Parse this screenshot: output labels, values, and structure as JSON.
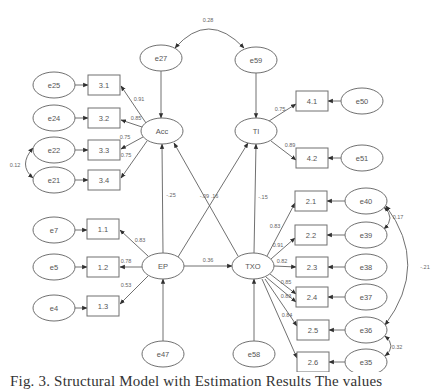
{
  "figure": {
    "caption": "Fig. 3.   Structural Model with Estimation Results  The values",
    "colors": {
      "stroke": "#707070",
      "text": "#555555",
      "background": "#ffffff"
    }
  },
  "latent": [
    {
      "id": "Acc",
      "label": "Acc",
      "x": 162,
      "y": 131,
      "rx": 21,
      "ry": 13
    },
    {
      "id": "TI",
      "label": "TI",
      "x": 256,
      "y": 131,
      "rx": 21,
      "ry": 13
    },
    {
      "id": "EP",
      "label": "EP",
      "x": 163,
      "y": 266,
      "rx": 21,
      "ry": 13
    },
    {
      "id": "TXO",
      "label": "TXO",
      "x": 253,
      "y": 266,
      "rx": 21,
      "ry": 13
    }
  ],
  "errors": [
    {
      "id": "e27",
      "label": "e27",
      "x": 161,
      "y": 58,
      "rx": 21,
      "ry": 13
    },
    {
      "id": "e59",
      "label": "e59",
      "x": 256,
      "y": 60,
      "rx": 21,
      "ry": 13
    },
    {
      "id": "e25",
      "label": "e25",
      "x": 54,
      "y": 85,
      "rx": 21,
      "ry": 13
    },
    {
      "id": "e24",
      "label": "e24",
      "x": 54,
      "y": 118,
      "rx": 21,
      "ry": 13
    },
    {
      "id": "e22",
      "label": "e22",
      "x": 54,
      "y": 150,
      "rx": 21,
      "ry": 13
    },
    {
      "id": "e21",
      "label": "e21",
      "x": 54,
      "y": 180,
      "rx": 21,
      "ry": 13
    },
    {
      "id": "e50",
      "label": "e50",
      "x": 362,
      "y": 101,
      "rx": 21,
      "ry": 13
    },
    {
      "id": "e51",
      "label": "e51",
      "x": 362,
      "y": 158,
      "rx": 21,
      "ry": 13
    },
    {
      "id": "e40",
      "label": "e40",
      "x": 366,
      "y": 201,
      "rx": 21,
      "ry": 13
    },
    {
      "id": "e39",
      "label": "e39",
      "x": 366,
      "y": 235,
      "rx": 21,
      "ry": 13
    },
    {
      "id": "e38",
      "label": "e38",
      "x": 366,
      "y": 267,
      "rx": 21,
      "ry": 13
    },
    {
      "id": "e37",
      "label": "e37",
      "x": 366,
      "y": 297,
      "rx": 21,
      "ry": 13
    },
    {
      "id": "e36",
      "label": "e36",
      "x": 366,
      "y": 330,
      "rx": 21,
      "ry": 13
    },
    {
      "id": "e35",
      "label": "e35",
      "x": 366,
      "y": 362,
      "rx": 21,
      "ry": 13
    },
    {
      "id": "e7",
      "label": "e7",
      "x": 54,
      "y": 230,
      "rx": 21,
      "ry": 13
    },
    {
      "id": "e5",
      "label": "e5",
      "x": 54,
      "y": 267,
      "rx": 21,
      "ry": 13
    },
    {
      "id": "e4",
      "label": "e4",
      "x": 54,
      "y": 308,
      "rx": 21,
      "ry": 13
    },
    {
      "id": "e47",
      "label": "e47",
      "x": 163,
      "y": 354,
      "rx": 21,
      "ry": 13
    },
    {
      "id": "e58",
      "label": "e58",
      "x": 254,
      "y": 354,
      "rx": 21,
      "ry": 13
    }
  ],
  "observed": [
    {
      "id": "3.1",
      "label": "3.1",
      "x": 104,
      "y": 85,
      "w": 32,
      "h": 20
    },
    {
      "id": "3.2",
      "label": "3.2",
      "x": 104,
      "y": 118,
      "w": 32,
      "h": 20
    },
    {
      "id": "3.3",
      "label": "3.3",
      "x": 104,
      "y": 150,
      "w": 32,
      "h": 20
    },
    {
      "id": "3.4",
      "label": "3.4",
      "x": 104,
      "y": 180,
      "w": 32,
      "h": 20
    },
    {
      "id": "4.1",
      "label": "4.1",
      "x": 312,
      "y": 101,
      "w": 32,
      "h": 20
    },
    {
      "id": "4.2",
      "label": "4.2",
      "x": 312,
      "y": 158,
      "w": 32,
      "h": 20
    },
    {
      "id": "2.1",
      "label": "2.1",
      "x": 311,
      "y": 201,
      "w": 32,
      "h": 20
    },
    {
      "id": "2.2",
      "label": "2.2",
      "x": 311,
      "y": 235,
      "w": 32,
      "h": 20
    },
    {
      "id": "2.3",
      "label": "2.3",
      "x": 312,
      "y": 267,
      "w": 32,
      "h": 20
    },
    {
      "id": "2.4",
      "label": "2.4",
      "x": 312,
      "y": 297,
      "w": 32,
      "h": 20
    },
    {
      "id": "2.5",
      "label": "2.5",
      "x": 313,
      "y": 330,
      "w": 32,
      "h": 20
    },
    {
      "id": "2.6",
      "label": "2.6",
      "x": 313,
      "y": 362,
      "w": 32,
      "h": 20
    },
    {
      "id": "1.1",
      "label": "1.1",
      "x": 103,
      "y": 229,
      "w": 32,
      "h": 20
    },
    {
      "id": "1.2",
      "label": "1.2",
      "x": 103,
      "y": 267,
      "w": 32,
      "h": 20
    },
    {
      "id": "1.3",
      "label": "1.3",
      "x": 103,
      "y": 306,
      "w": 32,
      "h": 20
    }
  ],
  "paths": [
    {
      "from": [
        161,
        71
      ],
      "to": [
        161,
        118
      ],
      "label": "",
      "lx": 0,
      "ly": 0
    },
    {
      "from": [
        256,
        73
      ],
      "to": [
        256,
        118
      ],
      "label": "",
      "lx": 0,
      "ly": 0
    },
    {
      "from": [
        33,
        85
      ],
      "to": [
        88,
        85
      ],
      "label": "",
      "lx": 0,
      "ly": 0
    },
    {
      "from": [
        33,
        118
      ],
      "to": [
        88,
        118
      ],
      "label": "",
      "lx": 0,
      "ly": 0
    },
    {
      "from": [
        33,
        150
      ],
      "to": [
        88,
        150
      ],
      "label": "",
      "lx": 0,
      "ly": 0
    },
    {
      "from": [
        33,
        180
      ],
      "to": [
        88,
        180
      ],
      "label": "",
      "lx": 0,
      "ly": 0
    },
    {
      "from": [
        146,
        123
      ],
      "to": [
        121,
        86
      ],
      "label": "0.91",
      "lx": 139,
      "ly": 99
    },
    {
      "from": [
        142,
        127
      ],
      "to": [
        121,
        120
      ],
      "label": "0.85",
      "lx": 136,
      "ly": 118
    },
    {
      "from": [
        143,
        137
      ],
      "to": [
        121,
        149
      ],
      "label": "0.75",
      "lx": 125,
      "ly": 137
    },
    {
      "from": [
        147,
        141
      ],
      "to": [
        121,
        178
      ],
      "label": "0.75",
      "lx": 126,
      "ly": 155
    },
    {
      "from": [
        271,
        141
      ],
      "to": [
        296,
        160
      ],
      "label": "0.89",
      "lx": 290,
      "ly": 145
    },
    {
      "from": [
        269,
        121
      ],
      "to": [
        296,
        104
      ],
      "label": "0.75",
      "lx": 280,
      "ly": 109
    },
    {
      "from": [
        341,
        101
      ],
      "to": [
        328,
        101
      ],
      "label": "",
      "lx": 0,
      "ly": 0
    },
    {
      "from": [
        341,
        158
      ],
      "to": [
        328,
        158
      ],
      "label": "",
      "lx": 0,
      "ly": 0
    },
    {
      "from": [
        345,
        201
      ],
      "to": [
        327,
        201
      ],
      "label": "",
      "lx": 0,
      "ly": 0
    },
    {
      "from": [
        345,
        235
      ],
      "to": [
        327,
        235
      ],
      "label": "",
      "lx": 0,
      "ly": 0
    },
    {
      "from": [
        345,
        267
      ],
      "to": [
        328,
        267
      ],
      "label": "",
      "lx": 0,
      "ly": 0
    },
    {
      "from": [
        345,
        297
      ],
      "to": [
        328,
        297
      ],
      "label": "",
      "lx": 0,
      "ly": 0
    },
    {
      "from": [
        345,
        330
      ],
      "to": [
        329,
        330
      ],
      "label": "",
      "lx": 0,
      "ly": 0
    },
    {
      "from": [
        345,
        362
      ],
      "to": [
        329,
        362
      ],
      "label": "",
      "lx": 0,
      "ly": 0
    },
    {
      "from": [
        267,
        256
      ],
      "to": [
        295,
        203
      ],
      "label": "0.83",
      "lx": 275,
      "ly": 226
    },
    {
      "from": [
        271,
        259
      ],
      "to": [
        295,
        238
      ],
      "label": "0.91",
      "lx": 278,
      "ly": 245
    },
    {
      "from": [
        274,
        266
      ],
      "to": [
        296,
        267
      ],
      "label": "0.82",
      "lx": 282,
      "ly": 261
    },
    {
      "from": [
        270,
        274
      ],
      "to": [
        296,
        294
      ],
      "label": "0.85",
      "lx": 286,
      "ly": 282
    },
    {
      "from": [
        266,
        277
      ],
      "to": [
        296,
        302
      ],
      "label": "0.83",
      "lx": 286,
      "ly": 296
    },
    {
      "from": [
        265,
        279
      ],
      "to": [
        297,
        326
      ],
      "label": "0.84",
      "lx": 287,
      "ly": 315
    },
    {
      "from": [
        262,
        279
      ],
      "to": [
        297,
        358
      ],
      "label": "",
      "lx": 0,
      "ly": 0
    },
    {
      "from": [
        33,
        230
      ],
      "to": [
        87,
        230
      ],
      "label": "",
      "lx": 0,
      "ly": 0
    },
    {
      "from": [
        33,
        267
      ],
      "to": [
        87,
        267
      ],
      "label": "",
      "lx": 0,
      "ly": 0
    },
    {
      "from": [
        33,
        308
      ],
      "to": [
        87,
        308
      ],
      "label": "",
      "lx": 0,
      "ly": 0
    },
    {
      "from": [
        148,
        256
      ],
      "to": [
        120,
        230
      ],
      "label": "0.83",
      "lx": 140,
      "ly": 240
    },
    {
      "from": [
        142,
        267
      ],
      "to": [
        120,
        267
      ],
      "label": "0.78",
      "lx": 126,
      "ly": 261
    },
    {
      "from": [
        148,
        276
      ],
      "to": [
        120,
        304
      ],
      "label": "0.53",
      "lx": 126,
      "ly": 285
    },
    {
      "from": [
        163,
        253
      ],
      "to": [
        162,
        144
      ],
      "label": "-.25",
      "lx": 171,
      "ly": 195
    },
    {
      "from": [
        178,
        257
      ],
      "to": [
        248,
        143
      ],
      "label": "",
      "lx": 0,
      "ly": 0
    },
    {
      "from": [
        238,
        256
      ],
      "to": [
        174,
        143
      ],
      "label": "-.09 .16",
      "lx": 209,
      "ly": 196
    },
    {
      "from": [
        184,
        266
      ],
      "to": [
        232,
        266
      ],
      "label": "0.36",
      "lx": 208,
      "ly": 260
    },
    {
      "from": [
        254,
        253
      ],
      "to": [
        256,
        144
      ],
      "label": "-.15",
      "lx": 263,
      "ly": 197
    },
    {
      "from": [
        163,
        341
      ],
      "to": [
        163,
        279
      ],
      "label": "",
      "lx": 0,
      "ly": 0
    },
    {
      "from": [
        254,
        341
      ],
      "to": [
        254,
        279
      ],
      "label": "",
      "lx": 0,
      "ly": 0
    }
  ],
  "covariances": [
    {
      "d": "M 175 48 Q 208 10 244 48",
      "label": "0.28",
      "lx": 208,
      "ly": 20
    },
    {
      "d": "M 33 148 Q 18 165 33 178",
      "label": "0.12",
      "lx": 15,
      "ly": 165
    },
    {
      "d": "M 384 207 Q 396 218 384 229",
      "label": "0.17",
      "lx": 398,
      "ly": 217
    },
    {
      "d": "M 386 206 Q 430 265 385 325",
      "label": "-.21",
      "lx": 425,
      "ly": 267
    },
    {
      "d": "M 385 336 Q 397 346 385 356",
      "label": "0.32",
      "lx": 397,
      "ly": 347
    }
  ]
}
